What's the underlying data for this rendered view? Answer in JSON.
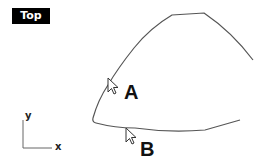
{
  "viewport": {
    "title": "Top",
    "curve_color": "#555555",
    "background": "#ffffff"
  },
  "points": {
    "a_label": "A",
    "b_label": "B"
  },
  "axes": {
    "x_label": "x",
    "y_label": "y"
  },
  "icons": [
    "cursor-arrow-icon",
    "cursor-arrow-icon"
  ]
}
